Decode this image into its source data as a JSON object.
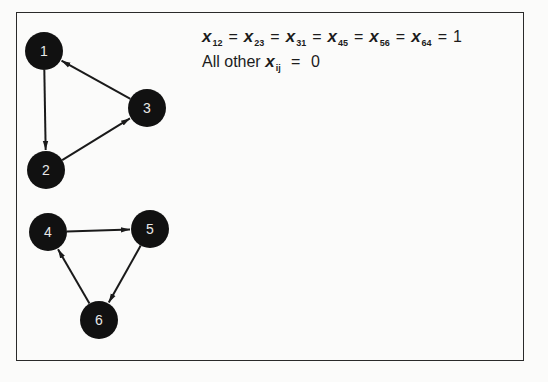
{
  "solution": {
    "variable": "x",
    "equal_vars": [
      "12",
      "23",
      "31",
      "45",
      "56",
      "64"
    ],
    "equals_sign": "=",
    "value_one": "1",
    "line2_prefix": "All other",
    "line2_sub": "ij",
    "line2_value": "0"
  },
  "graph": {
    "nodes": [
      {
        "id": "1",
        "label": "1",
        "x": 44,
        "y": 51
      },
      {
        "id": "2",
        "label": "2",
        "x": 46,
        "y": 170
      },
      {
        "id": "3",
        "label": "3",
        "x": 147,
        "y": 108
      },
      {
        "id": "4",
        "label": "4",
        "x": 48,
        "y": 232
      },
      {
        "id": "5",
        "label": "5",
        "x": 150,
        "y": 229
      },
      {
        "id": "6",
        "label": "6",
        "x": 99,
        "y": 320
      }
    ],
    "edges": [
      {
        "from": "1",
        "to": "2"
      },
      {
        "from": "2",
        "to": "3"
      },
      {
        "from": "3",
        "to": "1"
      },
      {
        "from": "4",
        "to": "5"
      },
      {
        "from": "5",
        "to": "6"
      },
      {
        "from": "6",
        "to": "4"
      }
    ],
    "node_color": "#111111",
    "label_color": "#e8e8e8"
  }
}
